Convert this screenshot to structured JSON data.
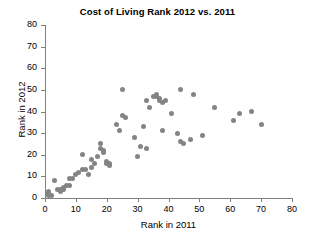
{
  "chart_data": {
    "type": "scatter",
    "title": "Cost of Living Rank 2012 vs. 2011",
    "xlabel": "Rank in 2011",
    "ylabel": "Rank in 2012",
    "xlim": [
      0,
      80
    ],
    "ylim": [
      0,
      80
    ],
    "xticks": [
      0,
      10,
      20,
      30,
      40,
      50,
      60,
      70,
      80
    ],
    "yticks": [
      0,
      10,
      20,
      30,
      40,
      50,
      60,
      70,
      80
    ],
    "grid": false,
    "legend": null,
    "marker_color": "#848484",
    "axis_color": "#808080",
    "points": [
      [
        1,
        2
      ],
      [
        1,
        3
      ],
      [
        1,
        1
      ],
      [
        2,
        1
      ],
      [
        3,
        8
      ],
      [
        4,
        4
      ],
      [
        5,
        4
      ],
      [
        5,
        3
      ],
      [
        6,
        5
      ],
      [
        6,
        4
      ],
      [
        7,
        6
      ],
      [
        8,
        6
      ],
      [
        8,
        9
      ],
      [
        9,
        9
      ],
      [
        10,
        11
      ],
      [
        11,
        12
      ],
      [
        12,
        13
      ],
      [
        12,
        20
      ],
      [
        13,
        13
      ],
      [
        14,
        11
      ],
      [
        15,
        18
      ],
      [
        15,
        14
      ],
      [
        16,
        16
      ],
      [
        17,
        19
      ],
      [
        18,
        25
      ],
      [
        18,
        23
      ],
      [
        19,
        22
      ],
      [
        19,
        21
      ],
      [
        20,
        16
      ],
      [
        20,
        17
      ],
      [
        21,
        15
      ],
      [
        21,
        16
      ],
      [
        23,
        34
      ],
      [
        24,
        31
      ],
      [
        25,
        50
      ],
      [
        25,
        38
      ],
      [
        26,
        37
      ],
      [
        29,
        28
      ],
      [
        30,
        19
      ],
      [
        31,
        24
      ],
      [
        32,
        33
      ],
      [
        33,
        45
      ],
      [
        33,
        23
      ],
      [
        34,
        42
      ],
      [
        35,
        47
      ],
      [
        36,
        48
      ],
      [
        36,
        47
      ],
      [
        37,
        46
      ],
      [
        37,
        45
      ],
      [
        38,
        44
      ],
      [
        38,
        31
      ],
      [
        39,
        45
      ],
      [
        41,
        39
      ],
      [
        43,
        30
      ],
      [
        44,
        50
      ],
      [
        44,
        26
      ],
      [
        45,
        25
      ],
      [
        47,
        27
      ],
      [
        48,
        48
      ],
      [
        51,
        29
      ],
      [
        55,
        42
      ],
      [
        61,
        36
      ],
      [
        63,
        39
      ],
      [
        67,
        40
      ],
      [
        70,
        34
      ]
    ]
  }
}
